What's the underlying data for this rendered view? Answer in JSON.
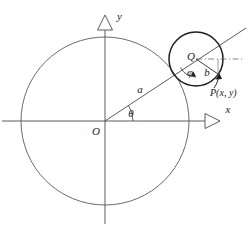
{
  "figure": {
    "background_color": "#ffffff",
    "ink_color": "#3a3a3a",
    "accent_color": "#1a1a1a",
    "width": 248,
    "height": 235
  },
  "axes": {
    "x_label": "x",
    "y_label": "y",
    "origin_label": "O",
    "arrowhead_style": "hollow-triangle",
    "x_axis": {
      "y": 121,
      "x_start": 2,
      "x_end": 214
    },
    "y_axis": {
      "x": 105,
      "y_start": 222,
      "y_end": 22
    }
  },
  "large_circle": {
    "label": "large-circle",
    "center": [
      105,
      121
    ],
    "radius": 84,
    "radius_label": "a"
  },
  "small_circle": {
    "label": "small-circle",
    "center": [
      196,
      59
    ],
    "radius": 27,
    "center_label": "Q",
    "radius_label": "b"
  },
  "angles": {
    "theta": {
      "label": "θ",
      "vertex": [
        105,
        121
      ],
      "value_deg": 34
    },
    "phi": {
      "label": "φ",
      "vertex": [
        196,
        59
      ],
      "value_deg": 34
    }
  },
  "points": {
    "P": {
      "label": "P(x, y)",
      "position": [
        218,
        74
      ]
    },
    "Q": {
      "label": "Q",
      "position": [
        196,
        59
      ]
    },
    "O": {
      "label": "O",
      "position": [
        105,
        121
      ]
    }
  },
  "ray": {
    "label": "ray-O-through-Q",
    "from": [
      105,
      121
    ],
    "to": [
      246,
      28
    ]
  },
  "reference_line": {
    "label": "horizontal-dash-dot-through-Q",
    "style": "dash-dot",
    "from": [
      196,
      59
    ],
    "to": [
      243,
      59
    ]
  }
}
